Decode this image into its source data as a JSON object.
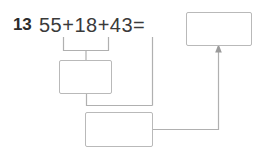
{
  "worksheet": {
    "problem_number": "13",
    "expression": "55+18+43=",
    "operands": [
      55,
      18,
      43
    ],
    "equals_sign": "=",
    "answer_boxes": [
      {
        "id": "blank-total",
        "label": "total-answer-box",
        "value": ""
      },
      {
        "id": "blank-partial",
        "label": "first-partial-sum-box",
        "value": ""
      },
      {
        "id": "blank-sum",
        "label": "final-sum-box",
        "value": ""
      }
    ],
    "connectors": [
      {
        "name": "bracket-55-plus-18",
        "from": "55+18",
        "to": "first-partial-sum-box"
      },
      {
        "name": "branch-43",
        "from": "43",
        "to": "final-sum-box"
      },
      {
        "name": "branch-partial-sum",
        "from": "first-partial-sum-box",
        "to": "final-sum-box"
      },
      {
        "name": "arrow-to-total",
        "from": "final-sum-box",
        "to": "total-answer-box",
        "has_arrowhead": true
      }
    ]
  },
  "colors": {
    "page_background": "#ffffff",
    "number_text": "#2b2b2b",
    "expression_text": "#3a3a3a",
    "box_border": "#b9b9b9",
    "connector_line": "#b0b0b0",
    "arrow_head": "#9a9a9a"
  }
}
